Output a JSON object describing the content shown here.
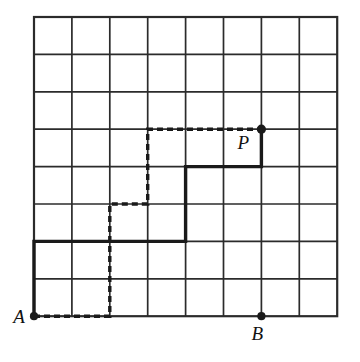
{
  "figure": {
    "type": "geometry-diagram",
    "background_color": "#ffffff",
    "ink_color": "#1a1a1a",
    "grid": {
      "columns": 8,
      "rows": 8,
      "origin_x": 34,
      "origin_y": 17,
      "cell_width": 37.9,
      "cell_height": 37.4,
      "line_color": "#2b2b2b",
      "line_width": 1.7,
      "border_width": 2.2
    },
    "points": [
      {
        "id": "A",
        "label": "A",
        "col": 0,
        "row": 8,
        "label_dx": -15,
        "label_dy": 7,
        "dot_radius": 4.1
      },
      {
        "id": "B",
        "label": "B",
        "col": 6,
        "row": 8,
        "label_dx": -4,
        "label_dy": 24,
        "dot_radius": 4.1
      },
      {
        "id": "P",
        "label": "P",
        "col": 6,
        "row": 3,
        "label_dx": -18,
        "label_dy": 20,
        "dot_radius": 4.6
      }
    ],
    "paths": [
      {
        "id": "solid-path",
        "name": "solid-path-a-to-p",
        "style": "solid",
        "stroke_width": 3.4,
        "color": "#1a1a1a",
        "from": "A",
        "to": "P",
        "moves": [
          "U",
          "U",
          "R",
          "R",
          "R",
          "R",
          "U",
          "U",
          "R",
          "R",
          "U"
        ],
        "vertices_colrow": [
          [
            0,
            8
          ],
          [
            0,
            6
          ],
          [
            4,
            6
          ],
          [
            4,
            4
          ],
          [
            6,
            4
          ],
          [
            6,
            3
          ]
        ]
      },
      {
        "id": "dashed-path",
        "name": "dashed-path-a-to-p",
        "style": "dashed",
        "stroke_width": 3.4,
        "color": "#1a1a1a",
        "dash_pattern": "6 4",
        "from": "A",
        "to": "P",
        "moves": [
          "R",
          "R",
          "U",
          "U",
          "U",
          "R",
          "U",
          "U",
          "R",
          "R",
          "R"
        ],
        "vertices_colrow": [
          [
            0,
            8
          ],
          [
            2,
            8
          ],
          [
            2,
            5
          ],
          [
            3,
            5
          ],
          [
            3,
            3
          ],
          [
            6,
            3
          ]
        ]
      }
    ]
  }
}
